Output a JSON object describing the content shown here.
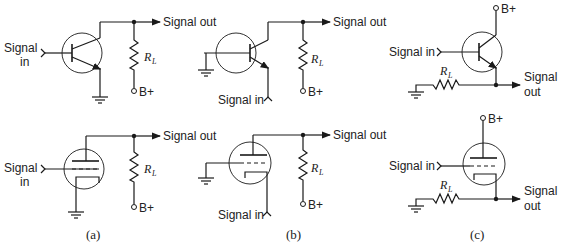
{
  "figure": {
    "panels": [
      {
        "id": "a",
        "caption": "(a)",
        "transistor": {
          "input_label_1": "Signal",
          "input_label_2": "in",
          "output_label": "Signal out",
          "resistor_label": "R",
          "resistor_sub": "L",
          "supply_label": "B+"
        },
        "tube": {
          "input_label_1": "Signal",
          "input_label_2": "in",
          "output_label": "Signal out",
          "resistor_label": "R",
          "resistor_sub": "L",
          "supply_label": "B+"
        }
      },
      {
        "id": "b",
        "caption": "(b)",
        "transistor": {
          "input_label": "Signal in",
          "output_label": "Signal out",
          "resistor_label": "R",
          "resistor_sub": "L",
          "supply_label": "B+"
        },
        "tube": {
          "input_label": "Signal in",
          "output_label": "Signal out",
          "resistor_label": "R",
          "resistor_sub": "L",
          "supply_label": "B+"
        }
      },
      {
        "id": "c",
        "caption": "(c)",
        "transistor": {
          "input_label": "Signal in",
          "output_label_1": "Signal",
          "output_label_2": "out",
          "resistor_label": "R",
          "resistor_sub": "L",
          "supply_label": "B+"
        },
        "tube": {
          "input_label": "Signal in",
          "output_label_1": "Signal",
          "output_label_2": "out",
          "resistor_label": "R",
          "resistor_sub": "L",
          "supply_label": "B+"
        }
      }
    ]
  }
}
